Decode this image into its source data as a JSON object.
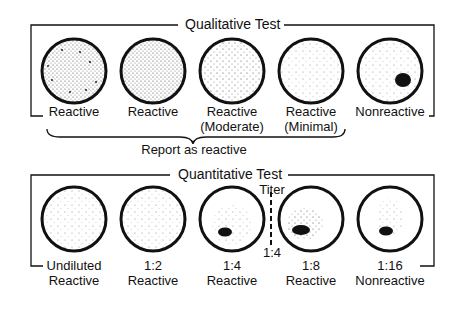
{
  "qualitative": {
    "title": "Qualitative Test",
    "items": [
      {
        "line1": "Reactive",
        "line2": "",
        "pattern": "dense-clumps"
      },
      {
        "line1": "Reactive",
        "line2": "",
        "pattern": "dense-fine"
      },
      {
        "line1": "Reactive",
        "line2": "(Moderate)",
        "pattern": "moderate"
      },
      {
        "line1": "Reactive",
        "line2": "(Minimal)",
        "pattern": "minimal"
      },
      {
        "line1": "Nonreactive",
        "line2": "",
        "pattern": "button"
      }
    ],
    "brace_label": "Report as reactive"
  },
  "quantitative": {
    "title": "Quantitative Test",
    "titer_label": "Titer",
    "titer_value": "1:4",
    "items": [
      {
        "line1": "Undiluted",
        "line2": "Reactive",
        "pattern": "fine"
      },
      {
        "line1": "1:2",
        "line2": "Reactive",
        "pattern": "fine"
      },
      {
        "line1": "1:4",
        "line2": "Reactive",
        "pattern": "partial-button"
      },
      {
        "line1": "1:8",
        "line2": "Reactive",
        "pattern": "button"
      },
      {
        "line1": "1:16",
        "line2": "Nonreactive",
        "pattern": "button-small"
      }
    ]
  }
}
